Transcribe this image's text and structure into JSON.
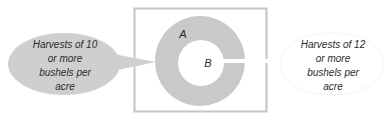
{
  "diagram": {
    "type": "venn-nested-sets",
    "universe_box": {
      "x": 134,
      "y": 8,
      "width": 133,
      "height": 104,
      "stroke": "#c4c4c4"
    },
    "set_a": {
      "label": "A",
      "cx": 200,
      "cy": 61,
      "r": 45,
      "fill": "#c9c9c9"
    },
    "set_b": {
      "label": "B",
      "cx": 201,
      "cy": 63,
      "r": 23,
      "fill": "#ffffff"
    },
    "callouts": [
      {
        "id": "left",
        "lines": [
          "Harvests of 10",
          "or more",
          "bushels per",
          "acre"
        ],
        "fill": "#cfcfcf",
        "points_to": "A"
      },
      {
        "id": "right",
        "lines": [
          "Harvests of 12",
          "or more",
          "bushels per",
          "acre"
        ],
        "fill": "#ffffff",
        "points_to": "B"
      }
    ]
  }
}
